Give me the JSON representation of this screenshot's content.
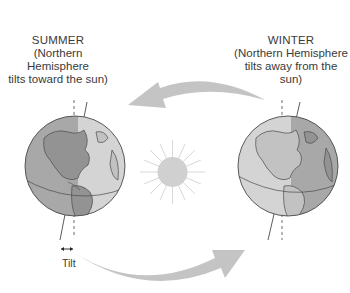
{
  "summer": {
    "title": "SUMMER",
    "line1": "(Northern Hemisphere",
    "line2": "tilts toward the sun)"
  },
  "winter": {
    "title": "WINTER",
    "line1": "(Northern Hemisphere",
    "line2": "tilts away from the sun)"
  },
  "tilt_label": "Tilt",
  "colors": {
    "arrow": "#c4c4c4",
    "sun": "#d0d0d0",
    "sun_rays": "#d8d8d8",
    "globe_dark": "#a8a8a8",
    "globe_light": "#d4d4d4",
    "land_dark": "#939393",
    "land_light": "#c2c2c2",
    "outline": "#4a4a4a"
  }
}
